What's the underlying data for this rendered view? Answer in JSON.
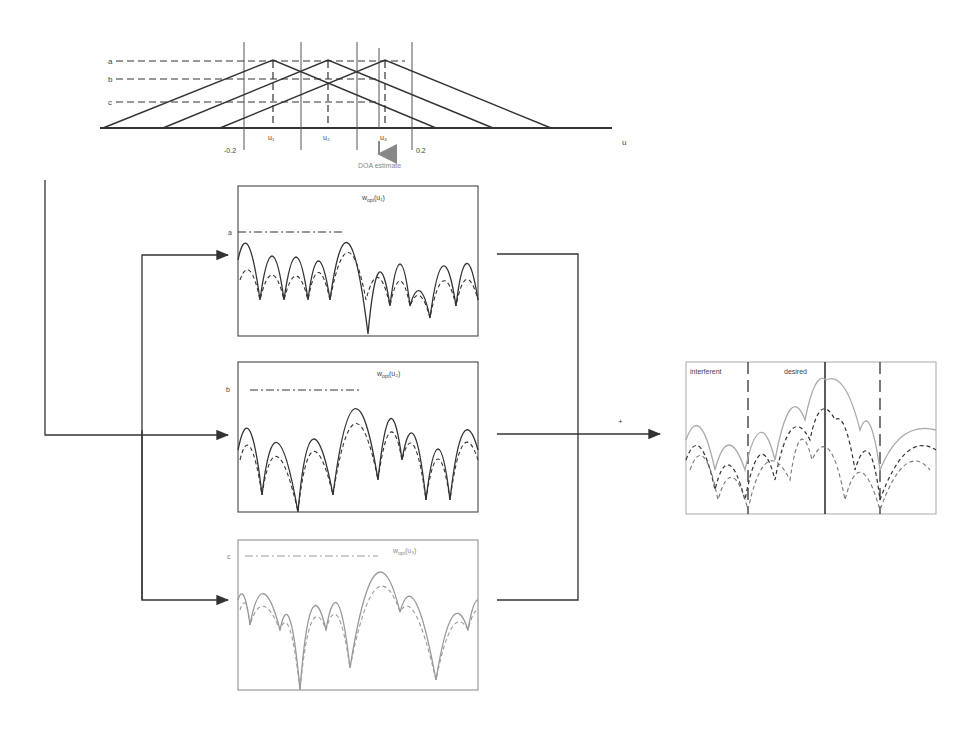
{
  "top_diagram": {
    "level_labels": [
      "a",
      "b",
      "c"
    ],
    "peak_labels": [
      "u₁",
      "u₂",
      "u₃"
    ],
    "axis_label": "u",
    "tick_left": "-0.2",
    "tick_right": "0.2",
    "doa_label": "DOA estimate"
  },
  "panels": [
    {
      "level_label": "a",
      "title": "w",
      "sub": "opt",
      "arg": "(u₁)"
    },
    {
      "level_label": "b",
      "title": "w",
      "sub": "opt",
      "arg": "(u₂)"
    },
    {
      "level_label": "c",
      "title": "w",
      "sub": "opt",
      "arg": "(u₃)"
    }
  ],
  "sum_sign": "+",
  "result_panel": {
    "label_interferent": "interferent",
    "label_desired": "desired"
  },
  "colors": {
    "line": "#333333",
    "faint": "#999999",
    "box": "#555555"
  }
}
